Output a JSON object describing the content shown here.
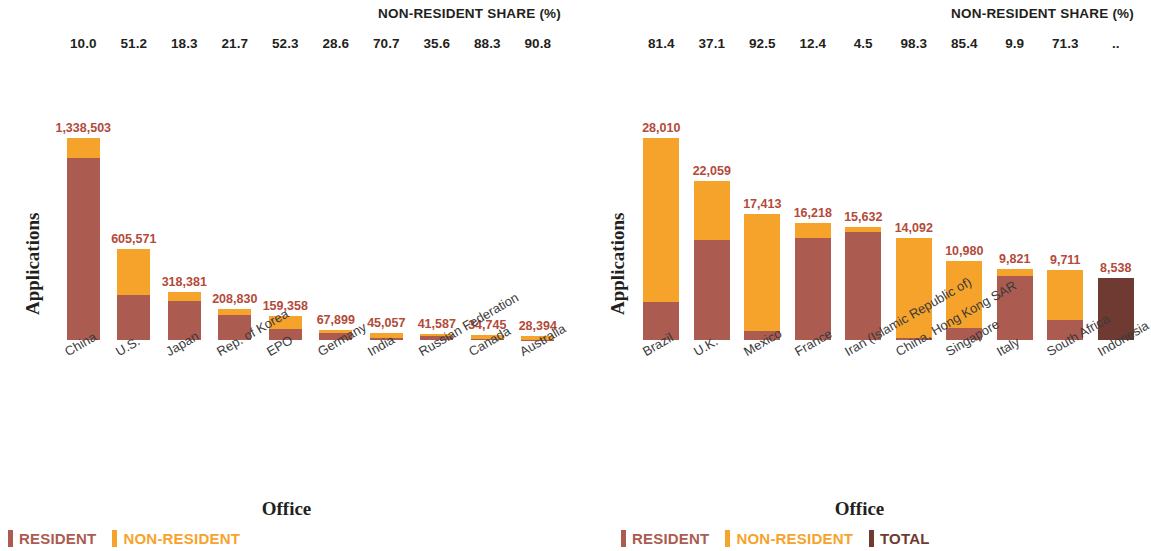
{
  "colors": {
    "resident": "#AC5B50",
    "non_resident": "#F6A32B",
    "total": "#6E3A31",
    "value_label": "#B34A3A",
    "text": "#231f20"
  },
  "panels": [
    {
      "share_title": "NON-RESIDENT SHARE (%)",
      "ylabel": "Applications",
      "xlabel": "Office",
      "shares": [
        "10.0",
        "51.2",
        "18.3",
        "21.7",
        "52.3",
        "28.6",
        "70.7",
        "35.6",
        "88.3",
        "90.8"
      ],
      "legend": [
        {
          "label": "RESIDENT",
          "color": "#AC5B50"
        },
        {
          "label": "NON-RESIDENT",
          "color": "#F6A32B"
        }
      ],
      "chart_data": {
        "type": "bar",
        "subtype": "stacked",
        "title": "NON-RESIDENT SHARE (%)",
        "xlabel": "Office",
        "ylabel": "Applications",
        "ylim": [
          0,
          1338503
        ],
        "grid": false,
        "legend_position": "bottom-left",
        "categories": [
          "China",
          "U.S.",
          "Japan",
          "Rep. of Korea",
          "EPO",
          "Germany",
          "India",
          "Russian Federation",
          "Canada",
          "Australia"
        ],
        "value_labels": [
          "1,338,503",
          "605,571",
          "318,381",
          "208,830",
          "159,358",
          "67,899",
          "45,057",
          "41,587",
          "34,745",
          "28,394"
        ],
        "totals": [
          1338503,
          605571,
          318381,
          208830,
          159358,
          67899,
          45057,
          41587,
          34745,
          28394
        ],
        "non_resident_share_pct": [
          10.0,
          51.2,
          18.3,
          21.7,
          52.3,
          28.6,
          70.7,
          35.6,
          88.3,
          90.8
        ],
        "series": [
          {
            "name": "RESIDENT",
            "color": "#AC5B50",
            "values": [
              1204653,
              295519,
              260117,
              163514,
              76004,
              48480,
              13202,
              26782,
              4065,
              2612
            ]
          },
          {
            "name": "NON-RESIDENT",
            "color": "#F6A32B",
            "values": [
              133850,
              310052,
              58264,
              45316,
              83354,
              19419,
              31855,
              14805,
              30680,
              25782
            ]
          }
        ]
      }
    },
    {
      "share_title": "NON-RESIDENT SHARE (%)",
      "ylabel": "Applications",
      "xlabel": "Office",
      "shares": [
        "81.4",
        "37.1",
        "92.5",
        "12.4",
        "4.5",
        "98.3",
        "85.4",
        "9.9",
        "71.3",
        ".."
      ],
      "legend": [
        {
          "label": "RESIDENT",
          "color": "#AC5B50"
        },
        {
          "label": "NON-RESIDENT",
          "color": "#F6A32B"
        },
        {
          "label": "TOTAL",
          "color": "#6E3A31"
        }
      ],
      "chart_data": {
        "type": "bar",
        "subtype": "stacked",
        "title": "NON-RESIDENT SHARE (%)",
        "xlabel": "Office",
        "ylabel": "Applications",
        "ylim": [
          0,
          28010
        ],
        "grid": false,
        "legend_position": "bottom-left",
        "categories": [
          "Brazil",
          "U.K.",
          "Mexico",
          "France",
          "Iran (Islamic Republic of)",
          "China, Hong Kong SAR",
          "Singapore",
          "Italy",
          "South Africa",
          "Indonesia"
        ],
        "value_labels": [
          "28,010",
          "22,059",
          "17,413",
          "16,218",
          "15,632",
          "14,092",
          "10,980",
          "9,821",
          "9,711",
          "8,538"
        ],
        "totals": [
          28010,
          22059,
          17413,
          16218,
          15632,
          14092,
          10980,
          9821,
          9711,
          8538
        ],
        "non_resident_share_pct": [
          81.4,
          37.1,
          92.5,
          12.4,
          4.5,
          98.3,
          85.4,
          9.9,
          71.3,
          null
        ],
        "series": [
          {
            "name": "RESIDENT",
            "color": "#AC5B50",
            "values": [
              5210,
              13875,
              1306,
              14207,
              14929,
              240,
              1603,
              8849,
              2787,
              0
            ]
          },
          {
            "name": "NON-RESIDENT",
            "color": "#F6A32B",
            "values": [
              22800,
              8184,
              16107,
              2011,
              703,
              13852,
              9377,
              972,
              6924,
              0
            ]
          },
          {
            "name": "TOTAL",
            "color": "#6E3A31",
            "values": [
              0,
              0,
              0,
              0,
              0,
              0,
              0,
              0,
              0,
              8538
            ]
          }
        ]
      }
    }
  ]
}
